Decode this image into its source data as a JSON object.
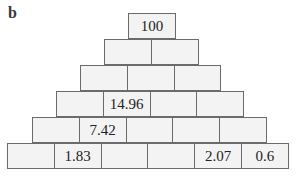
{
  "panel_label": "b",
  "pyramid": {
    "rows": [
      {
        "cells": [
          "100"
        ]
      },
      {
        "cells": [
          "",
          ""
        ]
      },
      {
        "cells": [
          "",
          "",
          ""
        ]
      },
      {
        "cells": [
          "",
          "14.96",
          "",
          ""
        ]
      },
      {
        "cells": [
          "",
          "7.42",
          "",
          "",
          ""
        ]
      },
      {
        "cells": [
          "",
          "1.83",
          "",
          "",
          "2.07",
          "0.6"
        ]
      }
    ]
  },
  "colors": {
    "cell_fill": "#f3f3f3",
    "cell_border": "#6b6b6b",
    "text": "#222222"
  }
}
